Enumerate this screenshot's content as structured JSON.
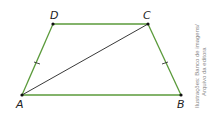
{
  "figure": {
    "type": "isosceles-trapezoid",
    "vertices": {
      "A": {
        "label": "A"
      },
      "B": {
        "label": "B"
      },
      "C": {
        "label": "C"
      },
      "D": {
        "label": "D"
      }
    },
    "sides": [
      "AB",
      "BC",
      "CD",
      "DA"
    ],
    "diagonal": "AC",
    "congruent_marks": [
      "AD",
      "BC"
    ],
    "colors": {
      "sides": "#5a9a3a",
      "diagonal": "#222222",
      "points": "#111111"
    }
  },
  "credit": {
    "line1": "Ilustrações: Banco de imagens/",
    "line2": "Arquivo da editora"
  }
}
